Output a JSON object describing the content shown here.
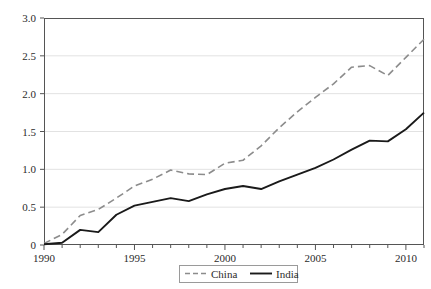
{
  "chart_data": {
    "type": "line",
    "title": "",
    "subtitle": "",
    "xlabel": "",
    "ylabel": "",
    "xlim": [
      1990,
      2011
    ],
    "ylim": [
      0,
      3.0
    ],
    "grid": true,
    "grid_axis": "y",
    "legend_position": "bottom-center",
    "x": [
      1990,
      1991,
      1992,
      1993,
      1994,
      1995,
      1996,
      1997,
      1998,
      1999,
      2000,
      2001,
      2002,
      2003,
      2004,
      2005,
      2006,
      2007,
      2008,
      2009,
      2010,
      2011
    ],
    "xticks": [
      1990,
      1995,
      2000,
      2005,
      2010
    ],
    "xticklabels": [
      "1990",
      "1995",
      "2000",
      "2005",
      "2010"
    ],
    "xminor_step": 1,
    "yticks": [
      0,
      0.5,
      1.0,
      1.5,
      2.0,
      2.5,
      3.0
    ],
    "yticklabels": [
      "0",
      "0.5",
      "1.0",
      "1.5",
      "2.0",
      "2.5",
      "3.0"
    ],
    "series": [
      {
        "name": "China",
        "color": "#8c8c8c",
        "linestyle": "dashed",
        "linewidth": 1.6,
        "values": [
          0.02,
          0.14,
          0.39,
          0.47,
          0.62,
          0.78,
          0.87,
          0.99,
          0.94,
          0.93,
          1.08,
          1.12,
          1.31,
          1.55,
          1.76,
          1.95,
          2.13,
          2.35,
          2.37,
          2.24,
          2.48,
          2.72
        ]
      },
      {
        "name": "India",
        "color": "#1a1a1a",
        "linestyle": "solid",
        "linewidth": 1.9,
        "values": [
          0.01,
          0.03,
          0.2,
          0.17,
          0.4,
          0.52,
          0.57,
          0.62,
          0.58,
          0.67,
          0.74,
          0.78,
          0.74,
          0.84,
          0.93,
          1.02,
          1.13,
          1.26,
          1.38,
          1.37,
          1.53,
          1.75
        ]
      }
    ],
    "legend": [
      {
        "label": "China",
        "color": "#8c8c8c",
        "linestyle": "dashed"
      },
      {
        "label": "India",
        "color": "#1a1a1a",
        "linestyle": "solid"
      }
    ],
    "colors": {
      "axis": "#555555",
      "grid": "#e2e2e2",
      "text": "#2b2b2b",
      "background": "#ffffff",
      "legend_border": "#9a9a9a"
    }
  }
}
